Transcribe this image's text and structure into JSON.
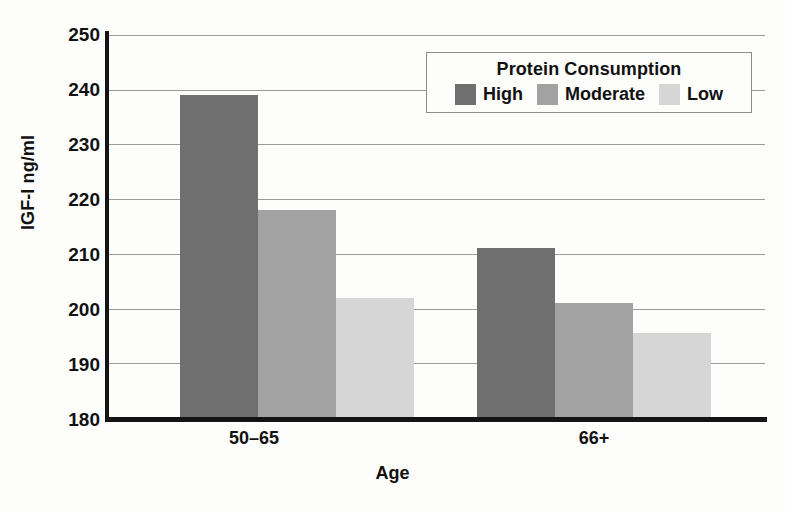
{
  "chart_data": {
    "type": "bar",
    "title": "",
    "subtitle": "",
    "xlabel": "Age",
    "ylabel": "IGF-I ng/ml",
    "categories": [
      "50–65",
      "66+"
    ],
    "series": [
      {
        "name": "High",
        "color": "#6f6f6f",
        "values": [
          239,
          211
        ]
      },
      {
        "name": "Moderate",
        "color": "#a2a2a2",
        "values": [
          218,
          201
        ]
      },
      {
        "name": "Low",
        "color": "#d6d6d6",
        "values": [
          202,
          195.5
        ]
      }
    ],
    "ylim": [
      180,
      250
    ],
    "ytick_values": [
      180,
      190,
      200,
      210,
      220,
      230,
      240,
      250
    ],
    "ytick_labels": [
      "180",
      "190",
      "200",
      "210",
      "220",
      "230",
      "240",
      "250"
    ],
    "grid": "horizontal",
    "legend_position": "top-right-inside",
    "legend_title": "Protein Consumption",
    "bar_grouping": "grouped-adjacent"
  },
  "axes": {
    "y_title": "IGF-I ng/ml",
    "x_title": "Age",
    "y_ticks": [
      "250",
      "240",
      "230",
      "220",
      "210",
      "200",
      "190",
      "180"
    ],
    "x_ticks": [
      "50–65",
      "66+"
    ]
  },
  "legend": {
    "title": "Protein Consumption",
    "entries": [
      {
        "label": "High",
        "color": "#6f6f6f"
      },
      {
        "label": "Moderate",
        "color": "#a2a2a2"
      },
      {
        "label": "Low",
        "color": "#d6d6d6"
      }
    ]
  },
  "colors": {
    "high": "#6f6f6f",
    "moderate": "#a2a2a2",
    "low": "#d6d6d6",
    "axis": "#141414",
    "grid": "#9a9a9a",
    "background": "#fdfdfc"
  }
}
